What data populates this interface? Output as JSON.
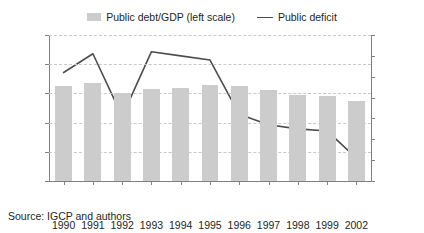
{
  "legend": {
    "items": [
      {
        "label": "Public debt/GDP (left scale)",
        "marker": "bar-swatch-icon",
        "color": "#cccccc"
      },
      {
        "label": "Public deficit",
        "marker": "line-swatch-icon",
        "color": "#4d4d4d"
      }
    ]
  },
  "source": {
    "text": "Source: IGCP and authors"
  },
  "chart_data": {
    "type": "bar",
    "title": "",
    "subtitle": "",
    "xlabel": "",
    "ylabel": "",
    "categories": [
      "1990",
      "1991",
      "1992",
      "1993",
      "1994",
      "1995",
      "1996",
      "1997",
      "1998",
      "1999",
      "2002"
    ],
    "category_notes": {
      "2002": "(est.)"
    },
    "grid": true,
    "legend_position": "top-center",
    "axes": {
      "left": {
        "label": "",
        "ticks": [
          "0%",
          "20%",
          "40%",
          "60%",
          "80%",
          "100%"
        ],
        "tick_values": [
          0,
          20,
          40,
          60,
          80,
          100
        ],
        "ylim": [
          0,
          100
        ],
        "unit": "%"
      },
      "right": {
        "label": "",
        "ticks": [
          "0%",
          "1%",
          "2%",
          "3%",
          "4%",
          "5%",
          "6%",
          "7%"
        ],
        "tick_values": [
          0,
          1,
          2,
          3,
          4,
          5,
          6,
          7
        ],
        "ylim": [
          0,
          7
        ],
        "unit": "%"
      }
    },
    "series": [
      {
        "name": "Public debt/GDP (left scale)",
        "type": "bar",
        "axis": "left",
        "color": "#cccccc",
        "values": [
          65,
          67,
          60,
          63,
          64,
          66,
          65,
          62,
          59,
          58,
          55
        ]
      },
      {
        "name": "Public deficit",
        "type": "line",
        "axis": "right",
        "color": "#4d4d4d",
        "values": [
          5.2,
          6.1,
          3.1,
          6.2,
          6.0,
          5.8,
          3.2,
          2.7,
          2.5,
          2.4,
          1.1
        ]
      }
    ]
  }
}
